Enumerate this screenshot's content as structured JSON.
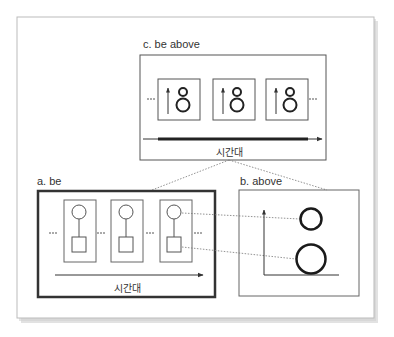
{
  "figure": {
    "panel_c": {
      "label": "c. be above",
      "timeline_label": "시간대",
      "frames": [
        {
          "icon": "arrow-up-with-stacked-circles"
        },
        {
          "icon": "arrow-up-with-stacked-circles"
        },
        {
          "icon": "arrow-up-with-stacked-circles"
        }
      ]
    },
    "panel_a": {
      "label": "a. be",
      "timeline_label": "시간대",
      "frames": [
        {
          "icon": "circle-over-square"
        },
        {
          "icon": "circle-over-square"
        },
        {
          "icon": "circle-over-square"
        }
      ]
    },
    "panel_b": {
      "label": "b. above",
      "elements": [
        "small-circle-upper",
        "large-circle-lower"
      ]
    },
    "colors": {
      "stroke": "#333333",
      "thin_stroke": "#555555",
      "frame_border": "#bbbbbb",
      "shadow": "#d8d8d8",
      "background": "#ffffff"
    }
  }
}
